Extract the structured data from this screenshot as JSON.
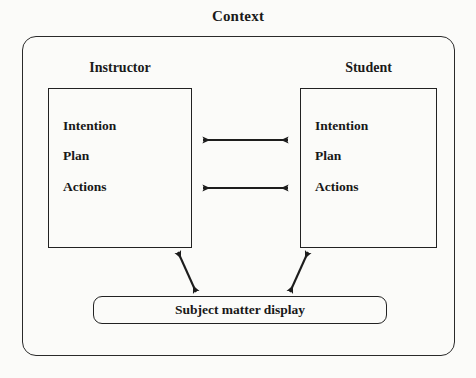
{
  "diagram": {
    "title": "Context",
    "actors": [
      {
        "name": "instructor",
        "heading": "Instructor",
        "items": [
          "Intention",
          "Plan",
          "Actions"
        ]
      },
      {
        "name": "student",
        "heading": "Student",
        "items": [
          "Intention",
          "Plan",
          "Actions"
        ]
      }
    ],
    "display": {
      "label": "Subject matter display"
    },
    "connections": [
      {
        "name": "instructor-student-upper",
        "from": "instructor",
        "to": "student",
        "style": "double-headed-horizontal"
      },
      {
        "name": "instructor-student-lower",
        "from": "instructor",
        "to": "student",
        "style": "double-headed-horizontal"
      },
      {
        "name": "instructor-display",
        "from": "instructor",
        "to": "display",
        "style": "double-headed-diagonal"
      },
      {
        "name": "student-display",
        "from": "student",
        "to": "display",
        "style": "double-headed-diagonal"
      }
    ],
    "colors": {
      "line": "#222222",
      "text": "#181818",
      "background": "#fbfbf9"
    }
  }
}
